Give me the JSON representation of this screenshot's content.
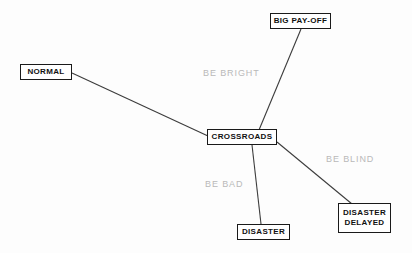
{
  "diagram": {
    "background_color": "#fdfdfd",
    "node_border_color": "#1a1a1a",
    "node_text_color": "#111111",
    "edge_color": "#3c3c3c",
    "edge_label_color": "#b9b9b9",
    "nodes": [
      {
        "id": "big-pay-off",
        "label": "BIG PAY-OFF",
        "x": 270,
        "y": 13,
        "width": 61,
        "height": 16
      },
      {
        "id": "normal",
        "label": "NORMAL",
        "x": 20,
        "y": 64,
        "width": 52,
        "height": 16
      },
      {
        "id": "crossroads",
        "label": "CROSSROADS",
        "x": 207,
        "y": 129,
        "width": 70,
        "height": 16
      },
      {
        "id": "disaster",
        "label": "DISASTER",
        "x": 237,
        "y": 224,
        "width": 53,
        "height": 16
      },
      {
        "id": "disaster-delayed",
        "label": "DISASTER\nDELAYED",
        "x": 338,
        "y": 203,
        "width": 53,
        "height": 30
      }
    ],
    "edges": [
      {
        "id": "normal-to-crossroads",
        "from": "normal",
        "to": "crossroads",
        "x1": 72,
        "y1": 73,
        "x2": 208,
        "y2": 136,
        "label": ""
      },
      {
        "id": "crossroads-to-big-pay-off",
        "from": "crossroads",
        "to": "big-pay-off",
        "x1": 259,
        "y1": 130,
        "x2": 301,
        "y2": 29,
        "label": "BE BRIGHT"
      },
      {
        "id": "crossroads-to-disaster",
        "from": "crossroads",
        "to": "disaster",
        "x1": 252,
        "y1": 145,
        "x2": 261,
        "y2": 224,
        "label": "BE BAD"
      },
      {
        "id": "crossroads-to-disaster-delayed",
        "from": "crossroads",
        "to": "disaster-delayed",
        "x1": 277,
        "y1": 142,
        "x2": 352,
        "y2": 204,
        "label": "BE BLIND"
      }
    ],
    "edge_labels": [
      {
        "id": "label-be-bright",
        "text": "BE BRIGHT",
        "x": 203,
        "y": 68
      },
      {
        "id": "label-be-blind",
        "text": "BE BLIND",
        "x": 326,
        "y": 154
      },
      {
        "id": "label-be-bad",
        "text": "BE BAD",
        "x": 205,
        "y": 179
      }
    ]
  }
}
